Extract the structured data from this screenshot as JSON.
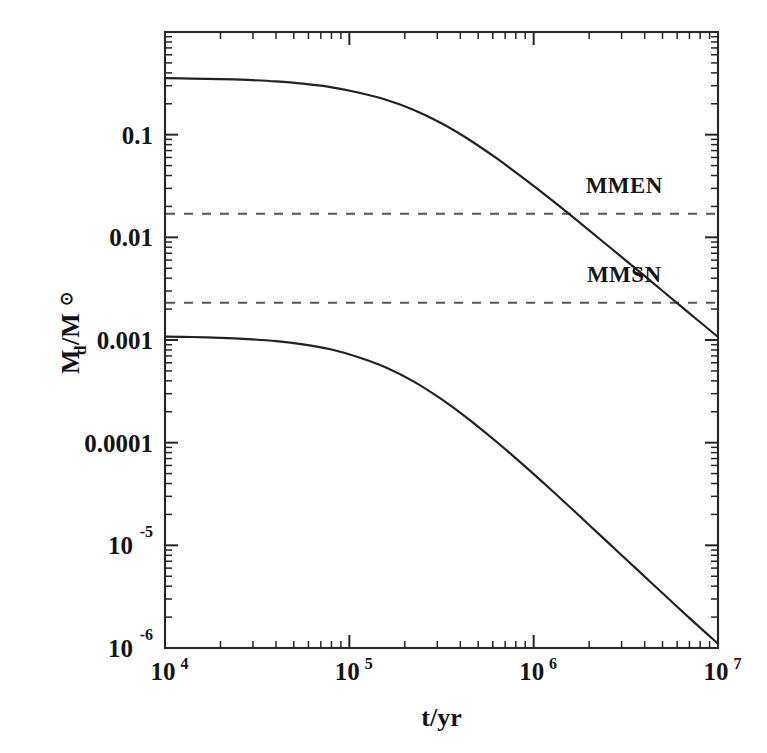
{
  "chart_data": {
    "type": "line",
    "title": "",
    "subtitle": "",
    "xlabel": "t/yr",
    "ylabel": "M_d/M_☉",
    "ylabel_parts": {
      "main1": "M",
      "sub": "d",
      "slash": "/M",
      "sun": "⊙"
    },
    "xscale": "log",
    "yscale": "log",
    "xlim": [
      10000,
      10000000
    ],
    "ylim": [
      1e-06,
      1.0
    ],
    "grid": false,
    "legend": null,
    "legend_position": "none",
    "x_ticks": [
      {
        "value": 10000,
        "label_base": "10",
        "label_exp": "4"
      },
      {
        "value": 100000,
        "label_base": "10",
        "label_exp": "5"
      },
      {
        "value": 1000000,
        "label_base": "10",
        "label_exp": "6"
      },
      {
        "value": 10000000,
        "label_base": "10",
        "label_exp": "7"
      }
    ],
    "y_ticks": [
      {
        "value": 0.1,
        "label_base": "0.1",
        "label_exp": ""
      },
      {
        "value": 0.01,
        "label_base": "0.01",
        "label_exp": ""
      },
      {
        "value": 0.001,
        "label_base": "0.001",
        "label_exp": ""
      },
      {
        "value": 0.0001,
        "label_base": "0.0001",
        "label_exp": ""
      },
      {
        "value": 1e-05,
        "label_base": "10",
        "label_exp": "-5"
      },
      {
        "value": 1e-06,
        "label_base": "10",
        "label_exp": "-6"
      }
    ],
    "series": [
      {
        "name": "massive-disc",
        "style": "solid",
        "color": "#222222",
        "x": [
          10000,
          14000,
          20000,
          28000,
          40000,
          56000,
          79000,
          110000,
          158000,
          224000,
          316000,
          447000,
          631000,
          891000,
          1260000,
          1780000,
          2510000,
          3550000,
          5010000,
          7080000,
          10000000
        ],
        "y": [
          0.355,
          0.352,
          0.348,
          0.341,
          0.33,
          0.314,
          0.291,
          0.259,
          0.219,
          0.174,
          0.129,
          0.0893,
          0.0587,
          0.0371,
          0.0229,
          0.0139,
          0.00837,
          0.00502,
          0.003,
          0.00179,
          0.00107
        ]
      },
      {
        "name": "low-mass-disc",
        "style": "solid",
        "color": "#222222",
        "x": [
          10000,
          14000,
          20000,
          28000,
          40000,
          56000,
          79000,
          110000,
          158000,
          224000,
          316000,
          447000,
          631000,
          891000,
          1260000,
          1780000,
          2510000,
          3550000,
          5010000,
          7080000,
          10000000
        ],
        "y": [
          0.00108,
          0.00107,
          0.00105,
          0.00102,
          0.000975,
          0.000908,
          0.000812,
          0.000686,
          0.00054,
          0.000393,
          0.000265,
          0.000168,
          0.0001015,
          5.94e-05,
          3.4e-05,
          1.92e-05,
          1.08e-05,
          6.06e-06,
          3.41e-06,
          1.92e-06,
          1.1e-06
        ]
      }
    ],
    "reference_lines": [
      {
        "name": "MMEN",
        "label": "MMEN",
        "value": 0.017,
        "style": "dashed",
        "color": "#555555"
      },
      {
        "name": "MMSN",
        "label": "MMSN",
        "value": 0.0023,
        "style": "dashed",
        "color": "#555555"
      }
    ],
    "annotations": [
      {
        "text": "MMEN",
        "x": 3100000,
        "y": 0.027
      },
      {
        "text": "MMSN",
        "x": 3100000,
        "y": 0.0037
      }
    ]
  },
  "plot_geometry": {
    "left": 165,
    "right": 718,
    "top": 32,
    "bottom": 648
  },
  "colors": {
    "background": "#ffffff",
    "axis": "#262626",
    "curve": "#222222",
    "reference": "#555555",
    "text": "#141414"
  }
}
